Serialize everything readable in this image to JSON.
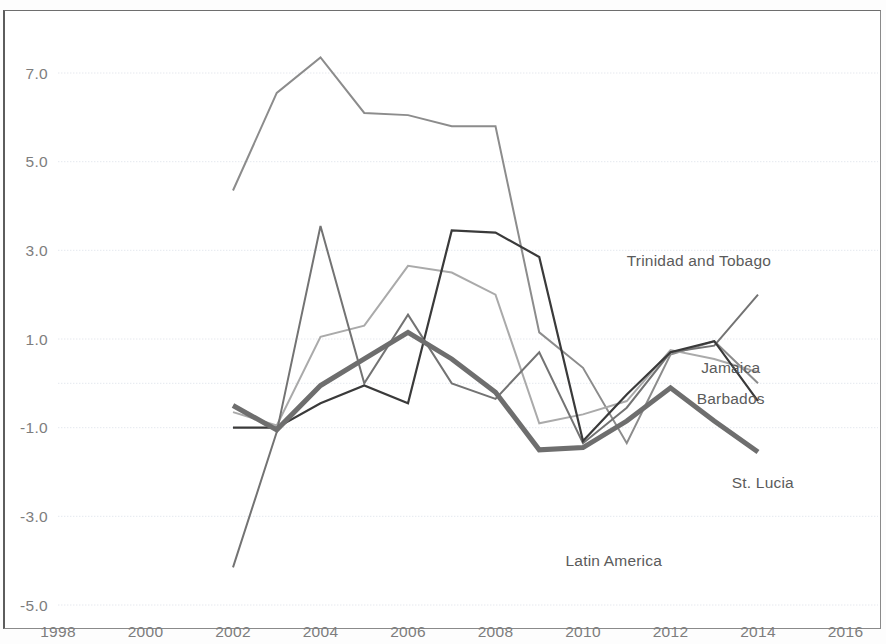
{
  "figure": {
    "background": "#ffffff",
    "frame_color": "#8a8a8a",
    "grid_color": "#d7dce6"
  },
  "chart_data": {
    "type": "line",
    "title": "",
    "xlabel": "",
    "ylabel": "",
    "xlim": [
      1997,
      2017
    ],
    "ylim": [
      -5.0,
      8.0
    ],
    "grid": true,
    "legend": "inline-labels",
    "xticks": [
      1998,
      2000,
      2002,
      2004,
      2006,
      2008,
      2010,
      2012,
      2014,
      2016
    ],
    "xtick_labels": [
      "1998",
      "2000",
      "2002",
      "2004",
      "2006",
      "2008",
      "2010",
      "2012",
      "2014",
      "2016"
    ],
    "yticks": [
      7.0,
      5.0,
      3.0,
      1.0,
      -1.0,
      -3.0,
      -5.0
    ],
    "ytick_labels": [
      "7.0",
      "5.0",
      "3.0",
      "1.0",
      "-1.0",
      "-3.0",
      "-5.0"
    ],
    "minor_gridlines": [
      0.0
    ],
    "x": [
      2002,
      2003,
      2004,
      2005,
      2006,
      2007,
      2008,
      2009,
      2010,
      2011,
      2012,
      2013,
      2014
    ],
    "series": [
      {
        "name": "Trinidad and Tobago",
        "color": "#8c8c8c",
        "width": 2.0,
        "label_x": 2011.0,
        "label_y": 2.75,
        "values": [
          4.35,
          6.55,
          7.35,
          6.1,
          6.05,
          5.8,
          5.8,
          1.15,
          0.35,
          -1.35,
          0.65,
          0.95,
          0.0
        ]
      },
      {
        "name": "Jamaica",
        "color": "#aaaaaa",
        "width": 2.0,
        "label_x": 2012.7,
        "label_y": 0.35,
        "values": [
          -0.65,
          -0.95,
          1.05,
          1.3,
          2.65,
          2.5,
          2.0,
          -0.9,
          -0.7,
          -0.4,
          0.75,
          0.55,
          0.25
        ]
      },
      {
        "name": "Barbados",
        "color": "#737373",
        "width": 2.0,
        "label_x": 2012.6,
        "label_y": -0.35,
        "values": [
          -4.15,
          -1.1,
          3.55,
          0.0,
          1.55,
          0.0,
          -0.35,
          0.7,
          -1.35,
          -0.55,
          0.7,
          0.85,
          2.0
        ]
      },
      {
        "name": "St. Lucia",
        "color": "#3a3a3a",
        "width": 2.2,
        "label_x": 2013.4,
        "label_y": -2.25,
        "values": [
          -1.0,
          -1.0,
          -0.45,
          -0.05,
          -0.45,
          3.45,
          3.4,
          2.85,
          -1.3,
          -0.25,
          0.7,
          0.95,
          -0.4
        ]
      },
      {
        "name": "Latin America",
        "color": "#6e6e6e",
        "width": 5.0,
        "label_x": 2009.6,
        "label_y": -4.0,
        "values": [
          -0.5,
          -1.05,
          -0.05,
          0.55,
          1.15,
          0.55,
          -0.2,
          -1.5,
          -1.45,
          -0.85,
          -0.1,
          -0.85,
          -1.55
        ]
      }
    ]
  }
}
